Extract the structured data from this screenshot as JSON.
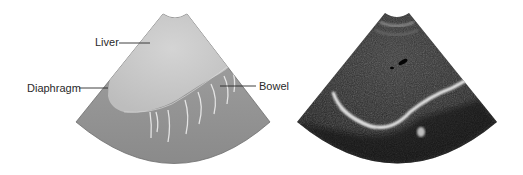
{
  "figure": {
    "left_panel": {
      "type": "schematic-illustration",
      "labels": [
        {
          "id": "liver",
          "text": "Liver"
        },
        {
          "id": "diaphragm",
          "text": "Diaphragm"
        },
        {
          "id": "bowel",
          "text": "Bowel"
        }
      ]
    },
    "right_panel": {
      "type": "ultrasound-image"
    },
    "colors": {
      "fan_outer": "#8e8e8e",
      "liver_region": "#c9c9c9",
      "ultrasound_bg": "#1a1a1a",
      "echo_bright": "#e6e6e6"
    }
  }
}
